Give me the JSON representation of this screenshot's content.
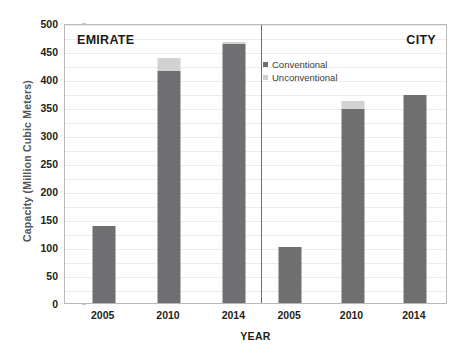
{
  "chart_data": {
    "type": "bar",
    "title": "",
    "xlabel": "YEAR",
    "ylabel": "Capacity  (Million Cubic Meters)",
    "ylabel_main": "Capacity",
    "ylabel_unit": "(Million Cubic Meters)",
    "ylim": [
      0,
      500
    ],
    "ytick_step": 50,
    "yticks": [
      500,
      450,
      400,
      350,
      300,
      250,
      200,
      150,
      100,
      50,
      0
    ],
    "grid": true,
    "stacked": true,
    "legend_position": "top-right-panel",
    "legend": [
      "Conventional",
      "Unconventional"
    ],
    "panels": [
      {
        "name": "EMIRATE",
        "title_align": "left",
        "categories": [
          "2005",
          "2010",
          "2014"
        ],
        "series": [
          {
            "name": "Conventional",
            "values": [
              138,
              415,
              462
            ]
          },
          {
            "name": "Unconventional",
            "values": [
              0,
              23,
              4
            ]
          }
        ],
        "totals": [
          138,
          438,
          466
        ]
      },
      {
        "name": "CITY",
        "title_align": "right",
        "categories": [
          "2005",
          "2010",
          "2014"
        ],
        "series": [
          {
            "name": "Conventional",
            "values": [
              100,
              347,
              372
            ]
          },
          {
            "name": "Unconventional",
            "values": [
              0,
              13,
              0
            ]
          }
        ],
        "totals": [
          100,
          360,
          372
        ]
      }
    ],
    "colors": {
      "conventional": "#6f6f72",
      "unconventional": "#d2d2d2",
      "gridline": "#ebecee",
      "frame": "#b9b9bb",
      "divider": "#6e6e71",
      "text": "#231f20",
      "axis_title": "#555558",
      "background": "#ffffff"
    }
  }
}
